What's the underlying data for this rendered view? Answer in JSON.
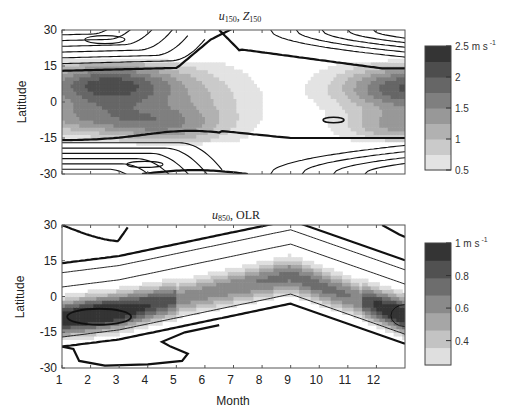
{
  "chart_data": [
    {
      "type": "heatmap",
      "panel": "top",
      "title": "u150, Z150",
      "title_parts": {
        "var1": "u",
        "sub1": "150",
        "sep": ", ",
        "var2": "Z",
        "sub2": "150"
      },
      "xlabel": "",
      "ylabel": "Latitude",
      "xlim": [
        1,
        13
      ],
      "ylim": [
        -30,
        30
      ],
      "yticks": [
        30,
        15,
        0,
        -15,
        -30
      ],
      "xticks": [
        1,
        2,
        3,
        4,
        5,
        6,
        7,
        8,
        9,
        10,
        11,
        12
      ],
      "x_tick_labels_shown": false,
      "grid": false,
      "shading_variable": "u150 variability",
      "shading_levels": [
        0.5,
        0.75,
        1.0,
        1.25,
        1.5,
        1.75,
        2.0,
        2.25,
        2.5
      ],
      "colorbar": {
        "ticks": [
          2.5,
          2,
          1.5,
          1,
          0.5
        ],
        "tick_labels": [
          "2.5 m s -1",
          "2",
          "1.5",
          "1",
          "0.5"
        ],
        "unit": "m s",
        "unit_exp": "-1",
        "range": [
          0.5,
          2.5
        ]
      },
      "features": [
        {
          "kind": "shading-max",
          "month": 2.5,
          "lat": 8,
          "value": 2.5
        },
        {
          "kind": "shading-max",
          "month": 12.8,
          "lat": 7,
          "value": 2.2
        },
        {
          "kind": "shading-min",
          "month": 8,
          "lat": 0,
          "value": 0.6
        },
        {
          "kind": "contour-thick",
          "description": "zero line near 13N Jan-Jun rising to 30N at Jul, returning 14N in Dec"
        },
        {
          "kind": "contour-thick",
          "description": "zero line near -15S across year"
        },
        {
          "kind": "contour-closed",
          "month": 10.5,
          "lat": -8
        }
      ]
    },
    {
      "type": "heatmap",
      "panel": "bottom",
      "title": "u850, OLR",
      "title_parts": {
        "var1": "u",
        "sub1": "850",
        "sep": ", ",
        "var2": "OLR",
        "sub2": ""
      },
      "xlabel": "Month",
      "ylabel": "Latitude",
      "xlim": [
        1,
        13
      ],
      "ylim": [
        -30,
        30
      ],
      "yticks": [
        30,
        15,
        0,
        -15,
        -30
      ],
      "xticks": [
        1,
        2,
        3,
        4,
        5,
        6,
        7,
        8,
        9,
        10,
        11,
        12
      ],
      "xtick_labels": [
        "1",
        "2",
        "3",
        "4",
        "5",
        "6",
        "7",
        "8",
        "9",
        "10",
        "11",
        "12"
      ],
      "grid": false,
      "shading_variable": "u850 variability",
      "shading_levels": [
        0.3,
        0.4,
        0.5,
        0.6,
        0.7,
        0.8,
        0.9,
        1.0
      ],
      "colorbar": {
        "ticks": [
          1,
          0.8,
          0.6,
          0.4
        ],
        "tick_labels": [
          "1 m s -1",
          "0.8",
          "0.6",
          "0.4"
        ],
        "unit": "m s",
        "unit_exp": "-1",
        "range": [
          0.25,
          1.0
        ]
      },
      "features": [
        {
          "kind": "shading-max",
          "month": 2.2,
          "lat": -9,
          "value": 1.0
        },
        {
          "kind": "shading-max",
          "month": 12.9,
          "lat": -8,
          "value": 0.9
        },
        {
          "kind": "shading-band",
          "description": "band migrating from -9S in Feb to +9N in Sep, back to -8S in Dec"
        }
      ]
    }
  ]
}
